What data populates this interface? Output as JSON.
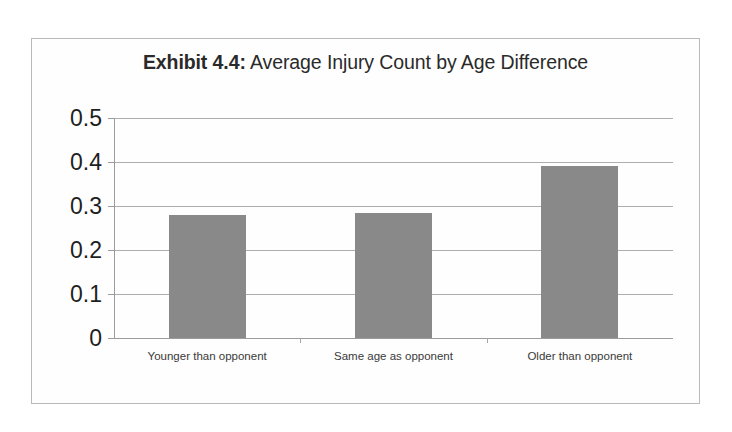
{
  "figure": {
    "title_strong": "Exhibit 4.4:",
    "title_rest": " Average Injury Count by Age Difference",
    "border_color": "#b9b9b9",
    "background_color": "#ffffff"
  },
  "chart_data": {
    "type": "bar",
    "title": "Exhibit 4.4: Average Injury Count by Age Difference",
    "categories": [
      "Younger than opponent",
      "Same age as opponent",
      "Older than opponent"
    ],
    "values": [
      0.28,
      0.285,
      0.39
    ],
    "xlabel": "",
    "ylabel": "",
    "ylim": [
      0,
      0.5
    ],
    "yticks": [
      0,
      0.1,
      0.2,
      0.3,
      0.4,
      0.5
    ],
    "ytick_labels": [
      "0",
      "0.1",
      "0.2",
      "0.3",
      "0.4",
      "0.5"
    ],
    "grid": true,
    "grid_axis": "y",
    "legend": false,
    "legend_position": "none",
    "bar_color": "#8a8a8a",
    "gridline_color": "#aeaeae",
    "axis_color": "#9c9c9c"
  }
}
